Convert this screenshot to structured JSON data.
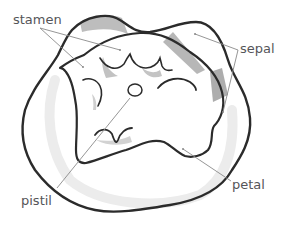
{
  "diagram": {
    "labels": {
      "stamen": "stamen",
      "sepal": "sepal",
      "pistil": "pistil",
      "petal": "petal"
    },
    "parts": [
      {
        "name": "stamen",
        "leaders": 2
      },
      {
        "name": "sepal",
        "leaders": 2
      },
      {
        "name": "pistil",
        "leaders": 1
      },
      {
        "name": "petal",
        "leaders": 1
      }
    ]
  },
  "colors": {
    "outline": "#2b2b2b",
    "shade": "#b9b9b9",
    "leader": "#8a8a8a",
    "label_text": "#555559",
    "background": "#ffffff"
  }
}
